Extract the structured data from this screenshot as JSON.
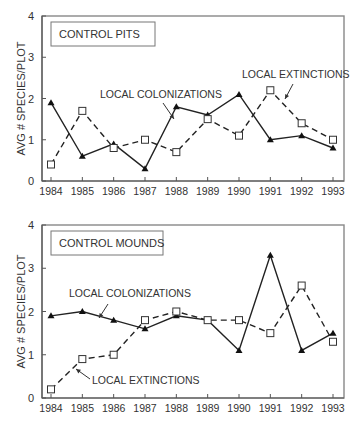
{
  "chart_data": [
    {
      "type": "line",
      "title": "CONTROL PITS",
      "xlabel": "",
      "ylabel": "AVG # SPECIES/PLOT",
      "ylim": [
        0,
        4
      ],
      "yticks": [
        "0",
        "1",
        "2",
        "3",
        "4"
      ],
      "grid": false,
      "categories": [
        "1984",
        "1985",
        "1986",
        "1987",
        "1988",
        "1989",
        "1990",
        "1991",
        "1992",
        "1993"
      ],
      "series": [
        {
          "name": "LOCAL COLONIZATIONS",
          "style": "solid",
          "marker": "triangle",
          "values": [
            1.9,
            0.6,
            0.9,
            0.3,
            1.8,
            1.6,
            2.1,
            1.0,
            1.1,
            0.8
          ]
        },
        {
          "name": "LOCAL EXTINCTIONS",
          "style": "dashed",
          "marker": "open-square",
          "values": [
            0.4,
            1.7,
            0.8,
            1.0,
            0.7,
            1.5,
            1.1,
            2.2,
            1.4,
            1.0
          ]
        }
      ],
      "annotations": [
        {
          "text": "LOCAL COLONIZATIONS",
          "x": 100,
          "y": 98,
          "arrow": [
            [
              163,
              103
            ],
            [
              174,
              119
            ]
          ]
        },
        {
          "text": "LOCAL EXTINCTIONS",
          "x": 242,
          "y": 78,
          "arrow": [
            [
              293,
              84
            ],
            [
              285,
              99
            ]
          ]
        }
      ]
    },
    {
      "type": "line",
      "title": "CONTROL MOUNDS",
      "xlabel": "",
      "ylabel": "AVG # SPECIES/PLOT",
      "ylim": [
        0,
        4
      ],
      "yticks": [
        "0",
        "1",
        "2",
        "3",
        "4"
      ],
      "grid": false,
      "categories": [
        "1984",
        "1985",
        "1986",
        "1987",
        "1988",
        "1989",
        "1990",
        "1991",
        "1992",
        "1993"
      ],
      "series": [
        {
          "name": "LOCAL COLONIZATIONS",
          "style": "solid",
          "marker": "triangle",
          "values": [
            1.9,
            2.0,
            1.8,
            1.6,
            1.9,
            1.8,
            1.1,
            3.3,
            1.1,
            1.5
          ]
        },
        {
          "name": "LOCAL EXTINCTIONS",
          "style": "dashed",
          "marker": "open-square",
          "values": [
            0.2,
            0.9,
            1.0,
            1.8,
            2.0,
            1.8,
            1.8,
            1.5,
            2.6,
            1.3
          ]
        }
      ],
      "annotations": [
        {
          "text": "LOCAL COLONIZATIONS",
          "x": 69,
          "y": 297,
          "arrow": [
            [
              108,
              304
            ],
            [
              99,
              318
            ]
          ]
        },
        {
          "text": "LOCAL EXTINCTIONS",
          "x": 92,
          "y": 384,
          "arrow": [
            [
              90,
              379
            ],
            [
              76,
              369
            ]
          ]
        }
      ]
    }
  ]
}
